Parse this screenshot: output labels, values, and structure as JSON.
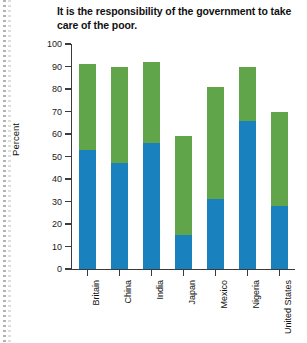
{
  "chart_data": {
    "type": "bar",
    "subtype": "stacked",
    "title": "It is the responsibility of the government to take care of the poor.",
    "xlabel": "",
    "ylabel": "Percent",
    "ylim": [
      0,
      100
    ],
    "ytick_step": 10,
    "yticks": [
      100,
      90,
      80,
      70,
      60,
      50,
      40,
      30,
      20,
      10,
      0
    ],
    "grid": false,
    "legend": "none",
    "categories": [
      "Britain",
      "China",
      "India",
      "Japan",
      "Mexico",
      "Nigeria",
      "United States"
    ],
    "series": [
      {
        "name": "Completely agree",
        "color": "#1a81bf",
        "values": [
          53,
          47,
          56,
          15,
          31,
          66,
          28
        ]
      },
      {
        "name": "Mostly agree",
        "color": "#61a54b",
        "values": [
          38,
          43,
          36,
          44,
          50,
          24,
          42
        ]
      }
    ],
    "totals": [
      91,
      90,
      92,
      59,
      81,
      90,
      70
    ]
  },
  "colors": {
    "blue": "#1a81bf",
    "green": "#61a54b",
    "axis": "#3b3b3b",
    "text": "#111111",
    "background": "#ffffff"
  }
}
